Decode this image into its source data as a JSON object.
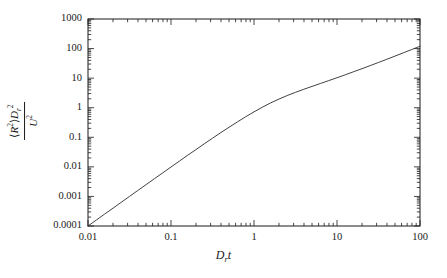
{
  "figure": {
    "name": "mean-squared-displacement-log-log-plot"
  },
  "axes": {
    "x": {
      "title_main": "D",
      "title_sub": "r",
      "title_tail": "t",
      "tick_labels": [
        "0.01",
        "0.1",
        "1",
        "10",
        "100"
      ]
    },
    "y": {
      "numerator_R": "R",
      "numerator_R_exp": "2",
      "numerator_D": "D",
      "numerator_D_sub": "r",
      "numerator_D_exp": "2",
      "denominator_U": "U",
      "denominator_U_exp": "2",
      "tick_labels": [
        "0.0001",
        "0.001",
        "0.01",
        "0.1",
        "1",
        "10",
        "100",
        "1000"
      ]
    }
  },
  "chart_data": {
    "type": "line",
    "title": "",
    "xlabel": "D_r t",
    "ylabel": "<R^2> D_r^2 / U^2",
    "xscale": "log",
    "yscale": "log",
    "xlim": [
      0.01,
      100
    ],
    "ylim": [
      0.0001,
      1000
    ],
    "grid": false,
    "legend": "none",
    "xticks": [
      0.01,
      0.1,
      1,
      10,
      100
    ],
    "yticks": [
      0.0001,
      0.001,
      0.01,
      0.1,
      1,
      10,
      100,
      1000
    ],
    "minor_ticks": true,
    "series": [
      {
        "name": "mean squared displacement",
        "color": "#2b2b2b",
        "linewidth": 0.9,
        "x": [
          0.01,
          0.0126,
          0.0158,
          0.02,
          0.0251,
          0.0316,
          0.0398,
          0.0501,
          0.0631,
          0.0794,
          0.1,
          0.126,
          0.158,
          0.2,
          0.251,
          0.316,
          0.398,
          0.501,
          0.631,
          0.794,
          1.0,
          1.26,
          1.58,
          2.0,
          2.51,
          3.16,
          3.98,
          5.01,
          6.31,
          7.94,
          10.0,
          12.6,
          15.8,
          20.0,
          25.1,
          31.6,
          39.8,
          50.1,
          63.1,
          79.4,
          100.0
        ],
        "y": [
          0.0001,
          0.000159,
          0.000251,
          0.000399,
          0.000632,
          0.001001,
          0.001585,
          0.002508,
          0.003967,
          0.006268,
          0.009896,
          0.015594,
          0.024501,
          0.038372,
          0.059841,
          0.092897,
          0.143257,
          0.219053,
          0.331266,
          0.494268,
          0.724065,
          1.03871,
          1.44742,
          1.9586,
          2.57628,
          3.3162,
          4.19917,
          5.26709,
          6.58229,
          8.23207,
          10.3266,
          13.0069,
          16.4397,
          20.8486,
          26.5293,
          33.8759,
          43.4039,
          55.7808,
          71.8624,
          92.7645,
          119.944
        ],
        "asymptote_short_time_slope": 2,
        "asymptote_long_time_slope": 1,
        "note": "ballistic to diffusive crossover near D_r t ~ 1"
      }
    ]
  }
}
